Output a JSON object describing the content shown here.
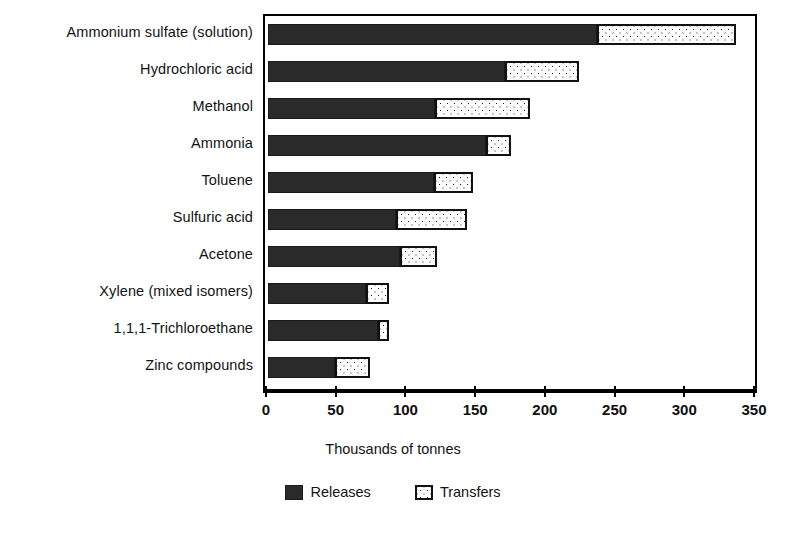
{
  "chart_data": {
    "type": "bar",
    "orientation": "horizontal",
    "stacked": true,
    "title": "",
    "xlabel": "Thousands of tonnes",
    "ylabel": "",
    "xlim": [
      0,
      350
    ],
    "xticks": [
      0,
      50,
      100,
      150,
      200,
      250,
      300,
      350
    ],
    "xticklabels": [
      "0",
      "50",
      "100",
      "150",
      "200",
      "250",
      "300",
      "350"
    ],
    "grid": false,
    "legend_position": "bottom-center",
    "categories": [
      "Ammonium sulfate (solution)",
      "Hydrochloric acid",
      "Methanol",
      "Ammonia",
      "Toluene",
      "Sulfuric acid",
      "Acetone",
      "Xylene (mixed isomers)",
      "1,1,1-Trichloroethane",
      "Zinc compounds"
    ],
    "series": [
      {
        "name": "Releases",
        "color": "#2a2a2a",
        "values": [
          236,
          170,
          120,
          156,
          119,
          92,
          95,
          70,
          79,
          48
        ]
      },
      {
        "name": "Transfers",
        "color": "#ffffff",
        "values": [
          100,
          53,
          68,
          18,
          28,
          51,
          26,
          17,
          8,
          25
        ]
      }
    ],
    "totals": [
      336,
      223,
      188,
      174,
      147,
      143,
      121,
      87,
      87,
      73
    ]
  },
  "axis_title": "Thousands of tonnes",
  "legend": {
    "items": [
      {
        "label": "Releases",
        "swatch": "filled-black-square"
      },
      {
        "label": "Transfers",
        "swatch": "stippled-white-square"
      }
    ]
  }
}
